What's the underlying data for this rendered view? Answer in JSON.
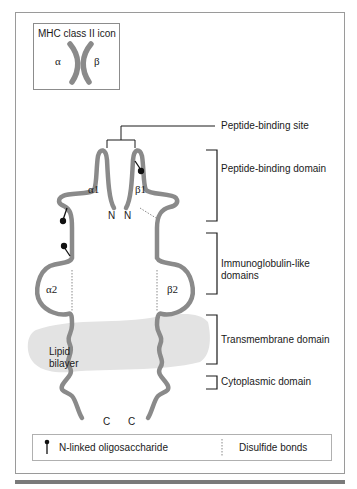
{
  "icon_box": {
    "title": "MHC class II icon",
    "alpha": "α",
    "beta": "β"
  },
  "chains": {
    "alpha1": "α1",
    "beta1": "β1",
    "alpha2": "α2",
    "beta2": "β2",
    "n_terminus_left": "N",
    "n_terminus_right": "N",
    "c_terminus_left": "C",
    "c_terminus_right": "C"
  },
  "membrane": {
    "label_line1": "Lipid",
    "label_line2": "bilayer"
  },
  "annotations": {
    "peptide_binding_site": "Peptide-binding site",
    "peptide_binding_domain": "Peptide-binding domain",
    "immunoglobulin_line1": "Immunoglobulin-like",
    "immunoglobulin_line2": "domains",
    "transmembrane_domain": "Transmembrane domain",
    "cytoplasmic_domain": "Cytoplasmic domain"
  },
  "legend": {
    "oligosaccharide": "N-linked oligosaccharide",
    "disulfide": "Disulfide bonds"
  },
  "colors": {
    "chain": "#8a8a8a",
    "membrane": "#e3e3e3",
    "ink": "#1a1a1a"
  }
}
